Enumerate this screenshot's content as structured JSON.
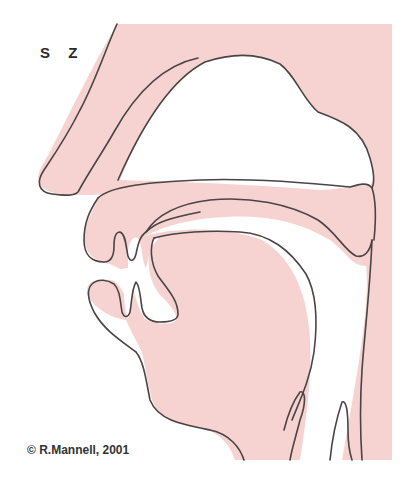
{
  "diagram": {
    "phoneme_labels": [
      "s",
      "z"
    ],
    "copyright": "© R.Mannell, 2001",
    "colors": {
      "tissue": "#f6d3d1",
      "outline": "#4a4444",
      "background": "#ffffff",
      "text": "#2a2a2a"
    },
    "regions": [
      "nose",
      "nasal-cavity",
      "hard-palate",
      "velum",
      "upper-lip",
      "upper-teeth",
      "lower-lip",
      "lower-teeth",
      "tongue",
      "oral-cavity",
      "pharynx",
      "epiglottis",
      "larynx",
      "chin"
    ]
  }
}
